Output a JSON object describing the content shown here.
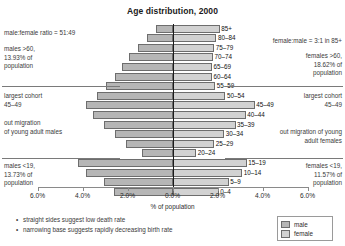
{
  "chart_data": {
    "type": "bar",
    "title": "Age distribution, 2000",
    "xlabel": "% of population",
    "ylabel": "",
    "xlim": [
      -6.0,
      6.0
    ],
    "xticks": [
      "6.0%",
      "4.0%",
      "2.0%",
      "0.0%",
      "2.0%",
      "4.0%",
      "6.0%"
    ],
    "grid": false,
    "legend_position": "bottom-right",
    "categories": [
      "85+",
      "80–84",
      "75–79",
      "70–74",
      "65–69",
      "60–64",
      "55–59",
      "50–54",
      "45–49",
      "40–44",
      "35–39",
      "30–34",
      "25–29",
      "20–24",
      "15–19",
      "10–14",
      "5–9",
      "0–4"
    ],
    "series": [
      {
        "name": "male",
        "values": [
          0.75,
          1.15,
          1.55,
          1.95,
          2.25,
          2.55,
          2.95,
          3.35,
          3.85,
          3.55,
          3.05,
          2.55,
          2.05,
          1.35,
          4.2,
          3.85,
          3.05,
          2.6
        ]
      },
      {
        "name": "female",
        "values": [
          2.1,
          1.95,
          1.85,
          1.8,
          1.75,
          1.75,
          1.9,
          2.35,
          3.65,
          3.25,
          2.8,
          2.3,
          1.85,
          1.05,
          3.3,
          3.1,
          2.5,
          2.05
        ]
      }
    ],
    "legend": [
      "male",
      "female"
    ],
    "colors": {
      "male": "#b6b6b6",
      "female": "#d2d2d2",
      "axis": "#1a1a1a"
    }
  },
  "annotations": {
    "left_ratio": "male:female ratio = 51:49",
    "left_over60": "males >60,\n13.93% of\npopulation",
    "left_cohort": "largest cohort\n45–49",
    "left_migration": "out migration\nof young adult males",
    "left_under19": "males <19,\n13.73% of\npopulation",
    "right_ratio": "female:male = 3:1 in 85+",
    "right_over60": "females >60,\n18.62% of\npopulation",
    "right_cohort": "largest cohort\n45–49",
    "right_migration": "out migration of young\nadult females",
    "right_under19": "females <19,\n11.57% of\npopulation"
  },
  "notes": [
    "straight sides suggest low death rate",
    "narrowing base suggests rapidly decreasing birth rate"
  ]
}
